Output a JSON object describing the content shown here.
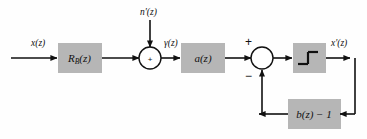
{
  "diagram": {
    "background_color": "#fefefe",
    "block_fill_color": "#b6b6b6",
    "line_color": "#111111",
    "blocks": [
      {
        "id": "rb",
        "label": "R",
        "subscript": "B",
        "suffix": "(z)",
        "name": "block-rb"
      },
      {
        "id": "a",
        "label": "a(z)",
        "name": "block-a"
      },
      {
        "id": "quantizer",
        "label": "",
        "glyph": "step-function",
        "name": "block-quantizer"
      },
      {
        "id": "feedback",
        "label": "b(z) − 1",
        "name": "block-feedback"
      }
    ],
    "signals": {
      "input": "x(z)",
      "noise": "n'(z)",
      "after_sum": "γ(z)",
      "output": "x'(z)"
    },
    "summers": [
      {
        "id": "sum1",
        "signs": [
          "+"
        ],
        "inner": "+"
      },
      {
        "id": "sum2",
        "signs": [
          "+",
          "−"
        ],
        "inner": ""
      }
    ],
    "sign_plus": "+",
    "sign_minus": "−"
  }
}
